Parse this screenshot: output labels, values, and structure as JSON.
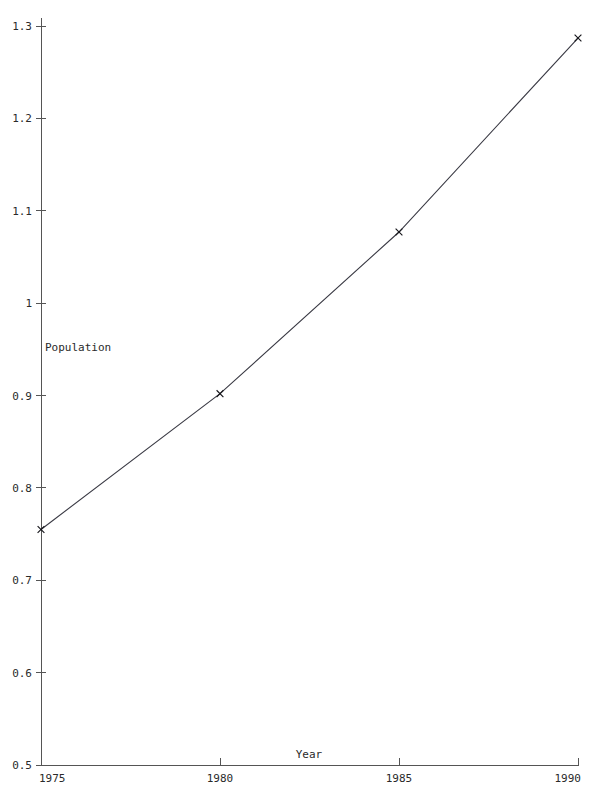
{
  "chart_data": {
    "type": "line",
    "title": "",
    "xlabel": "Year",
    "ylabel": "Population",
    "x": [
      1975,
      1980,
      1985,
      1990
    ],
    "values": [
      0.755,
      0.902,
      1.077,
      1.287
    ],
    "series": [
      {
        "name": "Population",
        "values": [
          0.755,
          0.902,
          1.077,
          1.287
        ]
      }
    ],
    "xlim": [
      1975,
      1990
    ],
    "ylim": [
      0.5,
      1.3
    ],
    "xticks": [
      1975,
      1980,
      1985,
      1990
    ],
    "yticks": [
      0.5,
      0.6,
      0.7,
      0.8,
      0.9,
      1.0,
      1.1,
      1.2,
      1.3
    ],
    "xtick_labels": [
      "1975",
      "1980",
      "1985",
      "1990"
    ],
    "ytick_labels": [
      "0.5",
      "0.6",
      "0.7",
      "0.8",
      "0.9",
      "1",
      "1.1",
      "1.2",
      "1.3"
    ],
    "grid": false,
    "legend": false,
    "legend_position": "none",
    "marker": "x",
    "line_color": "#3a3a44",
    "marker_color": "#17171c",
    "axis_color": "#555555",
    "background_color": "#ffffff"
  },
  "labels": {
    "y_axis_title": "Population",
    "x_axis_title": "Year"
  }
}
